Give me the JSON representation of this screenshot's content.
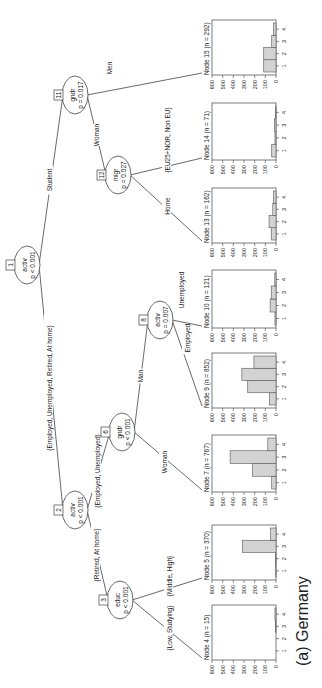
{
  "caption": "(a) Germany",
  "tree": {
    "inner_nodes": [
      {
        "id": "1",
        "var": "activ",
        "p": "p < 0.001"
      },
      {
        "id": "2",
        "var": "activ",
        "p": "p < 0.001"
      },
      {
        "id": "3",
        "var": "educ",
        "p": "p < 0.001"
      },
      {
        "id": "6",
        "var": "gndr",
        "p": "p < 0.001"
      },
      {
        "id": "8",
        "var": "activ",
        "p": "p = 0.007"
      },
      {
        "id": "11",
        "var": "gndr",
        "p": "p = 0.017"
      },
      {
        "id": "12",
        "var": "migr",
        "p": "p = 0.027"
      }
    ],
    "edges": [
      {
        "from": "1",
        "to": "2",
        "label": "{Employed, Unemployed, Retired, At home}"
      },
      {
        "from": "1",
        "to": "11",
        "label": "Student"
      },
      {
        "from": "2",
        "to": "3",
        "label": "{Retired, At home}"
      },
      {
        "from": "2",
        "to": "6",
        "label": "{Employed, Unemployed}"
      },
      {
        "from": "3",
        "to": "4",
        "label": "{Low, Studying}"
      },
      {
        "from": "3",
        "to": "5",
        "label": "{Middle, High}"
      },
      {
        "from": "6",
        "to": "7",
        "label": "Woman"
      },
      {
        "from": "6",
        "to": "8",
        "label": "Man"
      },
      {
        "from": "8",
        "to": "9",
        "label": "Employed"
      },
      {
        "from": "8",
        "to": "10",
        "label": "Unemployed"
      },
      {
        "from": "11",
        "to": "12",
        "label": "Woman"
      },
      {
        "from": "11",
        "to": "15",
        "label": "Men"
      },
      {
        "from": "12",
        "to": "13",
        "label": "Home"
      },
      {
        "from": "12",
        "to": "14",
        "label": "{EU25+NOR, Non EU}"
      }
    ]
  },
  "chart_data": {
    "type": "bar",
    "categories": [
      "1",
      "2",
      "3",
      "4"
    ],
    "ylim": [
      0,
      600
    ],
    "yticks": [
      "0",
      "100",
      "200",
      "300",
      "400",
      "500",
      "600"
    ],
    "terminal_nodes": [
      {
        "id": "4",
        "title": "Node 4 (n = 15)",
        "values": [
          0,
          0,
          5,
          10
        ]
      },
      {
        "id": "5",
        "title": "Node 5 (n = 370)",
        "values": [
          2,
          3,
          315,
          50
        ]
      },
      {
        "id": "7",
        "title": "Node 7 (n = 767)",
        "values": [
          40,
          220,
          430,
          77
        ]
      },
      {
        "id": "9",
        "title": "Node 9 (n = 852)",
        "values": [
          60,
          265,
          320,
          207
        ]
      },
      {
        "id": "10",
        "title": "Node 10 (n = 121)",
        "values": [
          10,
          55,
          45,
          11
        ]
      },
      {
        "id": "13",
        "title": "Node 13 (n = 162)",
        "values": [
          45,
          65,
          30,
          22
        ]
      },
      {
        "id": "14",
        "title": "Node 14 (n = 71)",
        "values": [
          40,
          10,
          15,
          6
        ]
      },
      {
        "id": "15",
        "title": "Node 15 (n = 292)",
        "values": [
          115,
          115,
          40,
          22
        ]
      }
    ]
  }
}
